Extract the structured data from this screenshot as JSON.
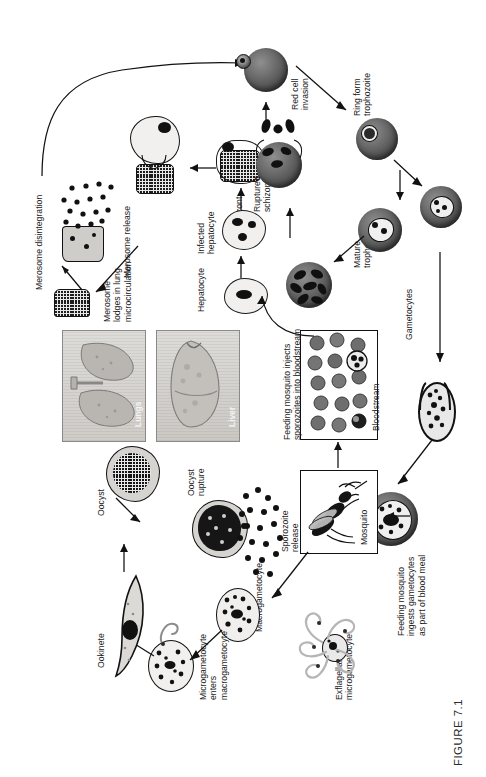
{
  "figure": {
    "caption": "FIGURE 7.1",
    "orientation": "labels rotated 90 degrees counter-clockwise",
    "background_color": "#ffffff",
    "ink_color": "#1a1a1a",
    "cell_color": "#4a4a4a"
  },
  "labels": {
    "merosome_disintegration": "Merosome disintegration",
    "merosome_release": "Merosome release",
    "merosome_lodges": "Merosome\nlodges in lung\nmicrocirculation",
    "infected_hepatocyte": "Infected\nhepatocyte",
    "hepatocyte": "Hepatocyte",
    "schizont_liver": "Schizont",
    "red_cell_invasion": "Red cell\ninvasion",
    "ring_form_trophozoite": "Ring form\ntrophozoite",
    "mature_trophozoite": "Mature\ntrophozoite",
    "ruptured_schizont": "Ruptured\nschizont",
    "schizont_blood": "Schizont",
    "gametocytes": "Gametocytes",
    "bloodstream": "Bloodstream",
    "lungs": "Lungs",
    "liver": "Liver",
    "feeding_mosquito_injects": "Feeding mosquito injects\nsporozoites into bloodstream",
    "sporozoite_release": "Sporozoite\nrelease",
    "mosquito": "Mosquito",
    "feeding_mosquito_ingests": "Feeding mosquito\ningests gametocytes\nas part of blood meal",
    "oocyst": "Oocyst",
    "oocyst_rupture": "Oocyst\nrupture",
    "ookinete": "Ookinete",
    "microgametocyte_enters": "Microgametocyte\nenters\nmacrogametocyte",
    "macrogametocyte": "Macrogametocyte",
    "exflagellated_microgametocyte": "Exflagellated\nmicrogametocyte"
  }
}
